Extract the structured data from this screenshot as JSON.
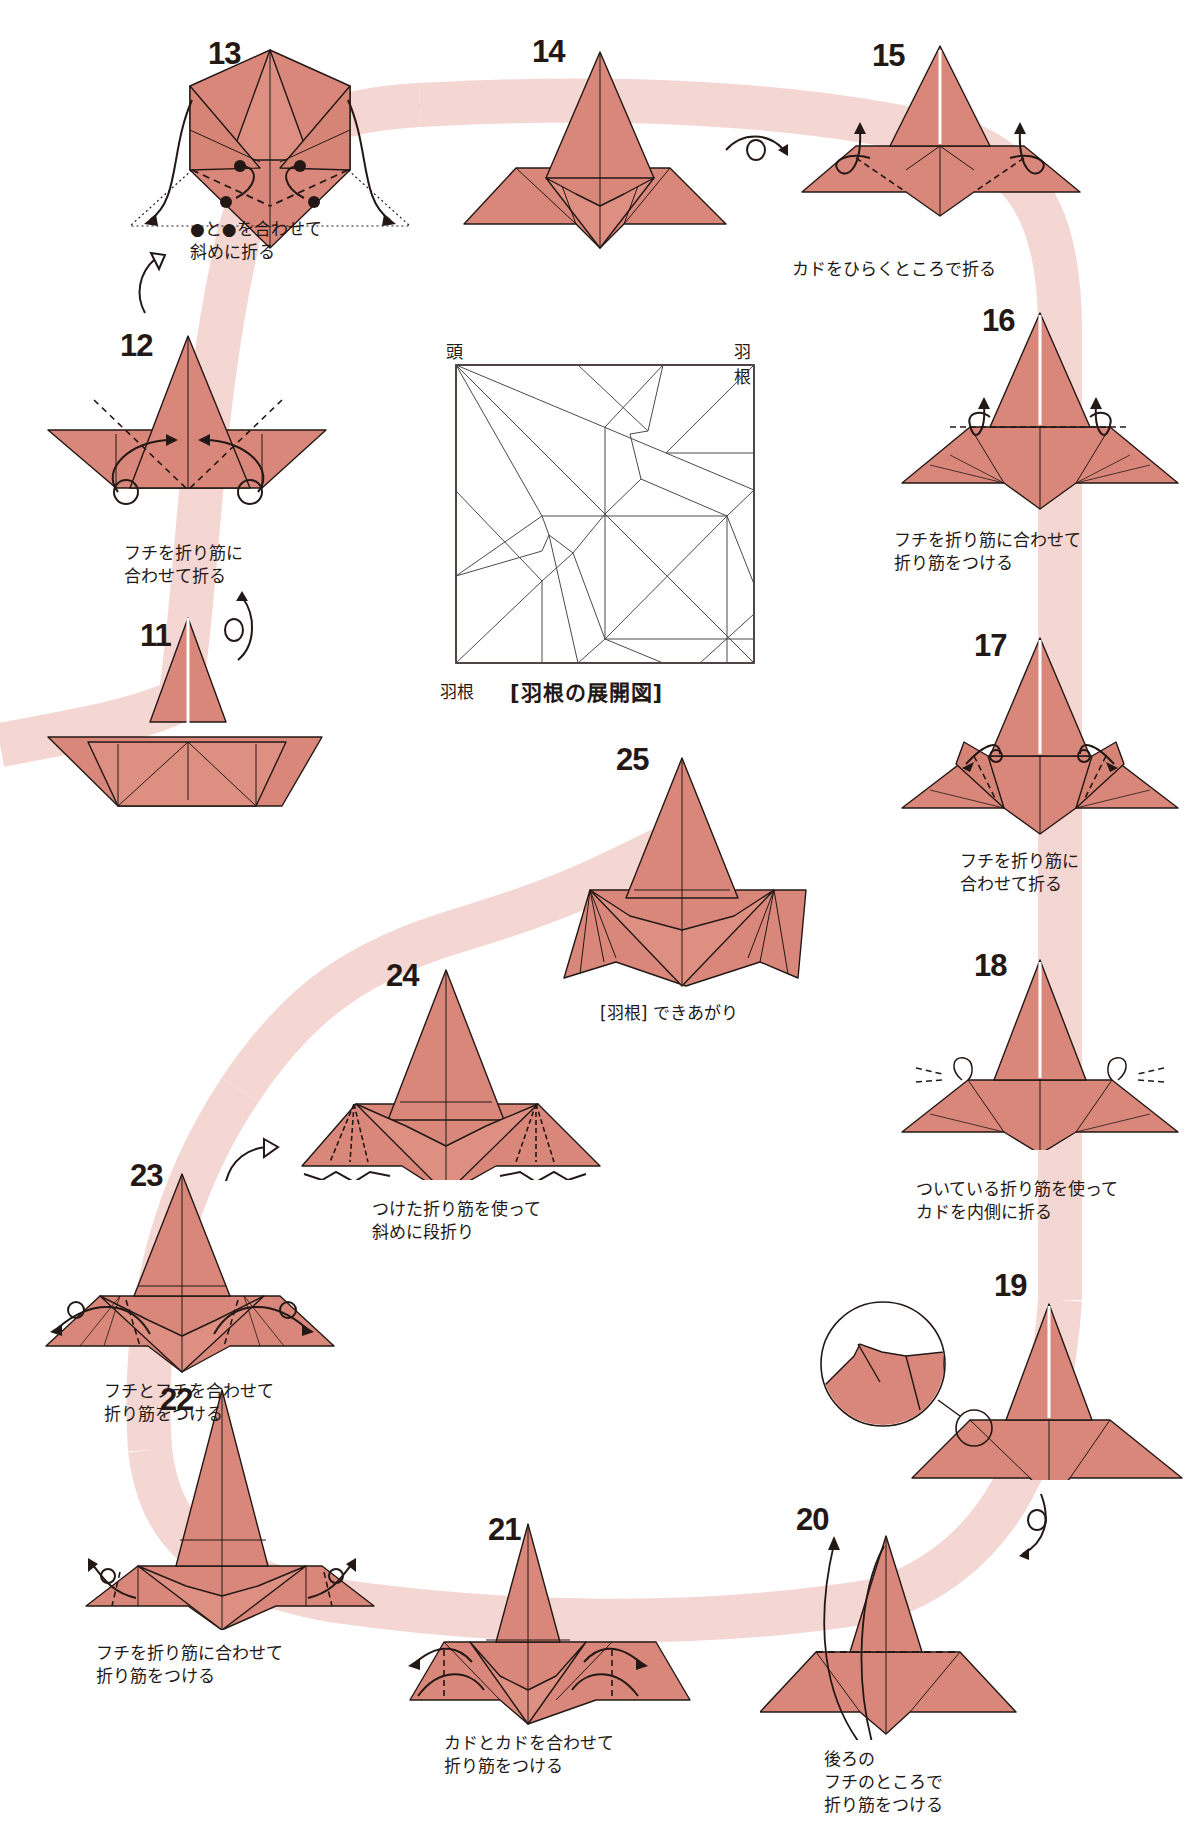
{
  "page": {
    "type": "origami-instruction-diagram",
    "colors": {
      "paper": "#d9877a",
      "paper_light": "#e6a396",
      "line": "#231815",
      "path_band": "#f2d3d0",
      "background": "#ffffff"
    }
  },
  "crease_pattern": {
    "title": "[羽根の展開図]",
    "corner_labels": {
      "top_left": "頭",
      "top_right": "羽根",
      "bottom_left": "羽根"
    }
  },
  "steps": [
    {
      "number": "11",
      "caption": [],
      "symbol": "turn-over-icon"
    },
    {
      "number": "12",
      "caption": [
        "フチを折り筋に",
        "合わせて折る"
      ]
    },
    {
      "number": "13",
      "caption": [
        "●と●を合わせて",
        "斜めに折る"
      ]
    },
    {
      "number": "14",
      "caption": [],
      "symbol": "turn-over-icon"
    },
    {
      "number": "15",
      "caption": [
        "カドをひらくところで折る"
      ]
    },
    {
      "number": "16",
      "caption": [
        "フチを折り筋に合わせて",
        "折り筋をつける"
      ]
    },
    {
      "number": "17",
      "caption": [
        "フチを折り筋に",
        "合わせて折る"
      ]
    },
    {
      "number": "18",
      "caption": [
        "ついている折り筋を使って",
        "カドを内側に折る"
      ]
    },
    {
      "number": "19",
      "caption": [],
      "symbol": "turn-over-icon",
      "detail": "magnified-circle"
    },
    {
      "number": "20",
      "caption": [
        "後ろの",
        "フチのところで",
        "折り筋をつける"
      ]
    },
    {
      "number": "21",
      "caption": [
        "カドとカドを合わせて",
        "折り筋をつける"
      ]
    },
    {
      "number": "22",
      "caption": [
        "フチを折り筋に合わせて",
        "折り筋をつける"
      ]
    },
    {
      "number": "23",
      "caption": [
        "フチとフチを合わせて",
        "折り筋をつける"
      ]
    },
    {
      "number": "24",
      "caption": [
        "つけた折り筋を使って",
        "斜めに段折り"
      ]
    },
    {
      "number": "25",
      "caption": [
        "[羽根] できあがり"
      ]
    }
  ]
}
